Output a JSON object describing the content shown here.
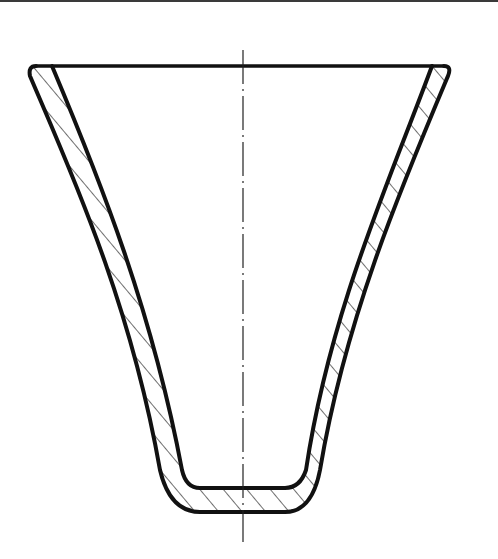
{
  "drawing": {
    "title": "Cross-section of conical cup (hatched wall section)",
    "type": "technical-section-drawing",
    "line_color": "#111111",
    "hatch_color": "#222222",
    "background": "#ffffff",
    "centerline": {
      "x": 243,
      "y1": 50,
      "y2": 542,
      "style": "dash-dot"
    },
    "rim": {
      "y": 66,
      "x_left": 36,
      "x_right": 444
    },
    "inner_bottom": {
      "y": 488,
      "x_left": 195,
      "x_right": 292
    },
    "outer_bottom": {
      "y": 512,
      "x_left": 190,
      "x_right": 297
    }
  }
}
